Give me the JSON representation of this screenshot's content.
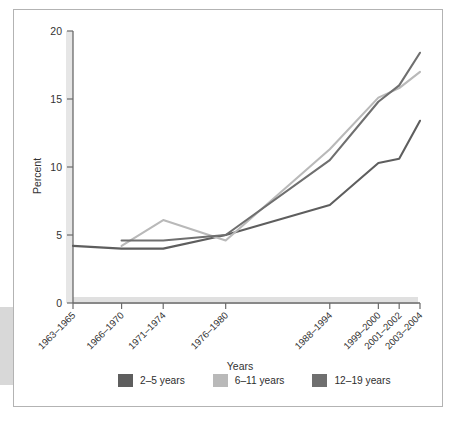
{
  "figure": {
    "axis_titles": {
      "x": "Years",
      "y": "Percent"
    }
  },
  "legend": {
    "items": [
      {
        "label": "2–5 years",
        "color": "#5e5e5e"
      },
      {
        "label": "6–11 years",
        "color": "#b9b9b9"
      },
      {
        "label": "12–19 years",
        "color": "#6f6f6f"
      }
    ]
  },
  "chart_data": {
    "type": "line",
    "title": "",
    "xlabel": "Years",
    "ylabel": "Percent",
    "ylim": [
      0,
      20
    ],
    "yticks": [
      0,
      5,
      10,
      15,
      20
    ],
    "ytick_labels": [
      "0",
      "5",
      "10",
      "15",
      "20"
    ],
    "grid": false,
    "legend_position": "bottom",
    "categories": [
      "1963–1965",
      "1966–1970",
      "1971–1974",
      "1976–1980",
      "1988–1994",
      "1999–2000",
      "2001–2002",
      "2003–2004"
    ],
    "category_positions": [
      0,
      14,
      26,
      44,
      74,
      88,
      94,
      100
    ],
    "series": [
      {
        "name": "2–5 years",
        "color": "#5e5e5e",
        "values": [
          4.2,
          4.0,
          4.0,
          5.0,
          7.2,
          10.3,
          10.6,
          13.4
        ]
      },
      {
        "name": "6–11 years",
        "color": "#b9b9b9",
        "values": [
          null,
          4.2,
          6.1,
          4.6,
          11.3,
          15.1,
          15.8,
          17.0
        ]
      },
      {
        "name": "12–19 years",
        "color": "#6f6f6f",
        "values": [
          null,
          4.6,
          4.6,
          5.0,
          10.5,
          14.8,
          16.0,
          18.4
        ]
      }
    ]
  }
}
